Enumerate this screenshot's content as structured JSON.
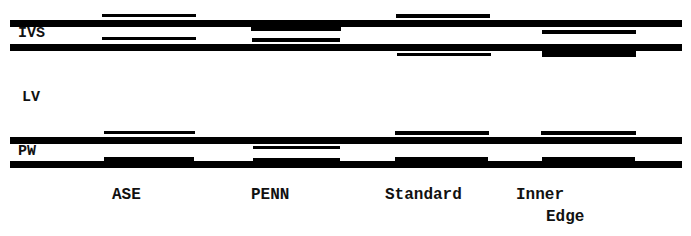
{
  "diagram": {
    "title": "",
    "colors": {
      "line": "#000000",
      "background": "#ffffff"
    },
    "row_labels": {
      "ivs": "IVS",
      "lv": "LV",
      "pw": "PW"
    },
    "columns": [
      {
        "label_line1": "ASE",
        "label_line2": ""
      },
      {
        "label_line1": "PENN",
        "label_line2": ""
      },
      {
        "label_line1": "Standard",
        "label_line2": ""
      },
      {
        "label_line1": "Inner",
        "label_line2": "Edge"
      }
    ]
  }
}
